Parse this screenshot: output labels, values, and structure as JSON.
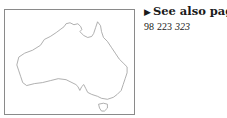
{
  "map": {
    "region": "Australia",
    "outline_color": "#9a9a9a",
    "frame_color": "#8a8a8a"
  },
  "see_also": {
    "arrow_icon": "right-triangle",
    "heading": "See also pages",
    "pages": [
      {
        "number": "98",
        "italic": false
      },
      {
        "number": "223",
        "italic": false
      },
      {
        "number": "323",
        "italic": true
      }
    ]
  }
}
